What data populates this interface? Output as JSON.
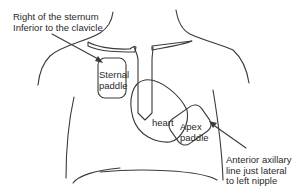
{
  "diagram": {
    "labels": {
      "sternal_location": [
        "Right of the sternum",
        "Inferior to the clavicle"
      ],
      "sternal_paddle": [
        "Sternal",
        "paddle"
      ],
      "heart": "heart",
      "apex_paddle": [
        "Apex",
        "paddle"
      ],
      "apex_location": [
        "Anterior axillary",
        "line just lateral",
        "to left nipple"
      ]
    },
    "colors": {
      "line": "#3a3a3a",
      "text": "#2a2a2a",
      "background": "#ffffff"
    }
  }
}
